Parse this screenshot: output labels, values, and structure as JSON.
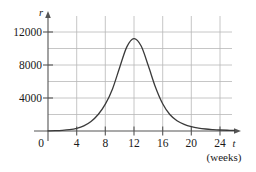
{
  "chart_data": {
    "type": "line",
    "title": "",
    "xlabel": "t",
    "xlabel_units": "(weeks)",
    "ylabel": "r",
    "xlim": [
      0,
      26
    ],
    "ylim": [
      0,
      13000
    ],
    "xticks": [
      0,
      4,
      8,
      12,
      16,
      20,
      24
    ],
    "xticklabels": [
      "0",
      "4",
      "8",
      "12",
      "16",
      "20",
      "24"
    ],
    "yticks": [
      4000,
      8000,
      12000
    ],
    "yticklabels": [
      "4000",
      "8000",
      "12000"
    ],
    "gridlines_y": [
      2000,
      4000,
      6000,
      8000,
      10000,
      12000
    ],
    "gridlines_x": [
      4,
      8,
      12,
      16,
      20,
      24
    ],
    "grid": true,
    "legend": "none",
    "peak": {
      "x": 12,
      "y": 11200
    },
    "x": [
      0,
      1,
      2,
      3,
      4,
      5,
      6,
      7,
      8,
      9,
      10,
      11,
      12,
      13,
      14,
      15,
      16,
      17,
      18,
      19,
      20,
      21,
      22,
      23,
      24,
      25,
      26
    ],
    "values": [
      20,
      40,
      80,
      160,
      320,
      620,
      1150,
      2000,
      3250,
      5100,
      7700,
      10200,
      11200,
      10300,
      7900,
      5300,
      3300,
      2000,
      1250,
      800,
      520,
      350,
      240,
      170,
      120,
      90,
      70
    ],
    "colors": {
      "curve": "#3a3a3a",
      "axis": "#555555",
      "grid": "#b8b8b8",
      "background": "#ffffff",
      "text": "#1a1a1a"
    }
  },
  "labels": {
    "y_axis_symbol": "r",
    "x_axis_symbol": "t",
    "x_axis_units": "(weeks)",
    "origin": "0",
    "y_4000": "4000",
    "y_8000": "8000",
    "y_12000": "12000",
    "x_4": "4",
    "x_8": "8",
    "x_12": "12",
    "x_16": "16",
    "x_20": "20",
    "x_24": "24"
  }
}
